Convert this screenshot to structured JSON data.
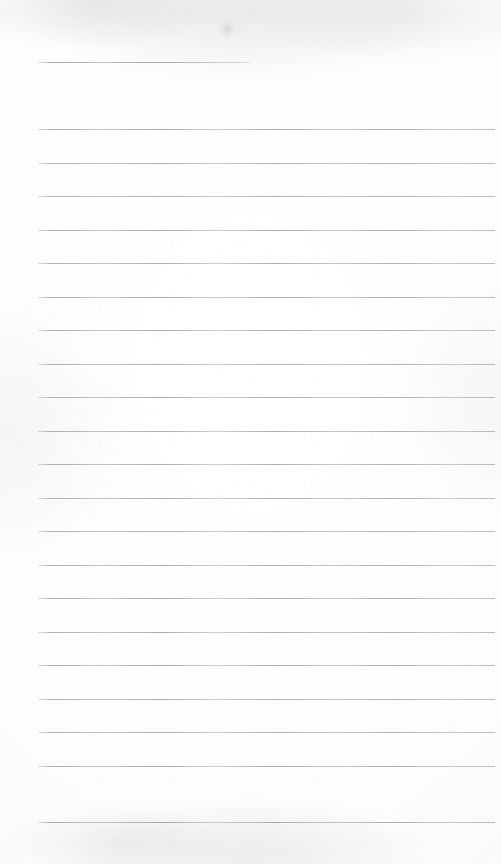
{
  "document": {
    "kind": "scanned-lined-paper",
    "title": "Blank ruled notepaper scan",
    "page_width": 501,
    "page_height": 864,
    "has_text": false,
    "text_content": "",
    "background_color": "#fdfdfd",
    "rule_color": "#9a9ca2",
    "rule_thickness_px": 1,
    "margin_rule": false,
    "left_margin_px": 38,
    "right_edge_px": 495,
    "line_spacing_px": 33.5,
    "rule_count": 22
  },
  "rules": [
    {
      "name": "rule-1",
      "y": 62,
      "x": 38,
      "width": 212,
      "variant": "short"
    },
    {
      "name": "rule-2",
      "y": 129,
      "x": 38,
      "width": 457,
      "variant": "full"
    },
    {
      "name": "rule-3",
      "y": 163,
      "x": 38,
      "width": 457,
      "variant": "full"
    },
    {
      "name": "rule-4",
      "y": 196,
      "x": 38,
      "width": 457,
      "variant": "full"
    },
    {
      "name": "rule-5",
      "y": 230,
      "x": 38,
      "width": 457,
      "variant": "full"
    },
    {
      "name": "rule-6",
      "y": 263,
      "x": 38,
      "width": 457,
      "variant": "full"
    },
    {
      "name": "rule-7",
      "y": 297,
      "x": 38,
      "width": 457,
      "variant": "full"
    },
    {
      "name": "rule-8",
      "y": 330,
      "x": 38,
      "width": 457,
      "variant": "full"
    },
    {
      "name": "rule-9",
      "y": 364,
      "x": 38,
      "width": 457,
      "variant": "full"
    },
    {
      "name": "rule-10",
      "y": 397,
      "x": 38,
      "width": 457,
      "variant": "full"
    },
    {
      "name": "rule-11",
      "y": 431,
      "x": 38,
      "width": 457,
      "variant": "full"
    },
    {
      "name": "rule-12",
      "y": 464,
      "x": 38,
      "width": 457,
      "variant": "full"
    },
    {
      "name": "rule-13",
      "y": 498,
      "x": 38,
      "width": 457,
      "variant": "full"
    },
    {
      "name": "rule-14",
      "y": 531,
      "x": 38,
      "width": 457,
      "variant": "full"
    },
    {
      "name": "rule-15",
      "y": 565,
      "x": 38,
      "width": 457,
      "variant": "full"
    },
    {
      "name": "rule-16",
      "y": 598,
      "x": 38,
      "width": 457,
      "variant": "full"
    },
    {
      "name": "rule-17",
      "y": 632,
      "x": 38,
      "width": 457,
      "variant": "full"
    },
    {
      "name": "rule-18",
      "y": 665,
      "x": 38,
      "width": 457,
      "variant": "full"
    },
    {
      "name": "rule-19",
      "y": 699,
      "x": 38,
      "width": 457,
      "variant": "full"
    },
    {
      "name": "rule-20",
      "y": 732,
      "x": 38,
      "width": 457,
      "variant": "full"
    },
    {
      "name": "rule-21",
      "y": 766,
      "x": 38,
      "width": 457,
      "variant": "full"
    },
    {
      "name": "rule-22",
      "y": 822,
      "x": 38,
      "width": 457,
      "variant": "full"
    }
  ],
  "marks": [
    {
      "name": "smudge-top",
      "x": 218,
      "y": 18,
      "width": 18,
      "height": 22
    }
  ]
}
